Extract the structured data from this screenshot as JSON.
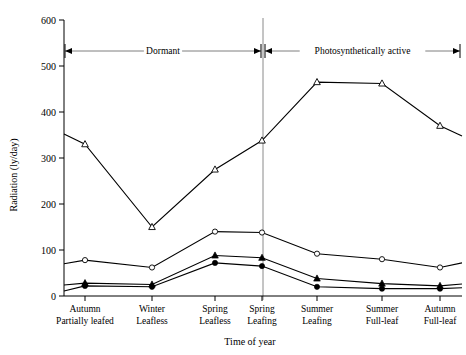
{
  "chart_data": {
    "type": "line",
    "title": "",
    "xlabel": "Time of year",
    "ylabel": "Radiation  (ly/day)",
    "ylim": [
      0,
      600
    ],
    "yticks": [
      0,
      100,
      200,
      300,
      400,
      500,
      600
    ],
    "ytick_labels": [
      "0",
      "100",
      "200",
      "300",
      "400",
      "500",
      "600"
    ],
    "grid": false,
    "legend": "none",
    "categories": [
      "Autumn\nPartially leafed",
      "Winter\nLeafless",
      "Spring\nLeafless",
      "Spring\nLeafing",
      "Summer\nLeafing",
      "Summer\nFull-leaf",
      "Autumn\nFull-leaf"
    ],
    "category_lines": [
      [
        "Autumn",
        "Partially leafed"
      ],
      [
        "Winter",
        "Leafless"
      ],
      [
        "Spring",
        "Leafless"
      ],
      [
        "Spring",
        "Leafing"
      ],
      [
        "Summer",
        "Leafing"
      ],
      [
        "Summer",
        "Full-leaf"
      ],
      [
        "Autumn",
        "Full-leaf"
      ]
    ],
    "series": [
      {
        "name": "Above canopy (open triangle)",
        "marker": "open-triangle",
        "values": [
          330,
          150,
          275,
          338,
          465,
          462,
          370
        ],
        "lead_in_value": 352,
        "tail_out_value": 348
      },
      {
        "name": "Sub-canopy upper (open circle)",
        "marker": "open-circle",
        "values": [
          78,
          62,
          140,
          138,
          92,
          80,
          62
        ],
        "lead_in_value": 70,
        "tail_out_value": 72
      },
      {
        "name": "Sub-canopy middle (filled triangle)",
        "marker": "filled-triangle",
        "values": [
          28,
          25,
          88,
          83,
          38,
          27,
          22
        ],
        "lead_in_value": 24,
        "tail_out_value": 26
      },
      {
        "name": "Sub-canopy lower (filled circle)",
        "marker": "filled-circle",
        "values": [
          22,
          20,
          72,
          65,
          20,
          16,
          16
        ],
        "lead_in_value": 11,
        "tail_out_value": 18
      }
    ],
    "annotations": [
      {
        "label": "Dormant",
        "from_category": 0,
        "to_category": 2,
        "style": "double-arrow"
      },
      {
        "label": "Photosynthetically  active",
        "from_category": 3,
        "to_category": 6,
        "style": "double-arrow"
      }
    ],
    "divider": {
      "between_categories": [
        2,
        3
      ],
      "description": "vertical separator between Dormant and Photosynthetically active periods"
    }
  }
}
